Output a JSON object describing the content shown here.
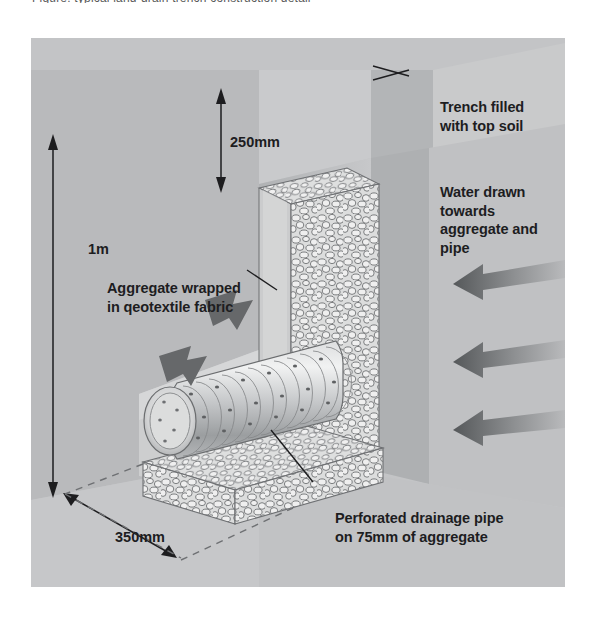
{
  "figure": {
    "clipped_caption_top": "Figure: typical land-drain trench construction detail",
    "background_color": "#c3c4c6",
    "panel": {
      "x": 31,
      "y": 38,
      "width": 534,
      "height": 549
    }
  },
  "labels": {
    "trench": "Trench filled\nwith top soil",
    "water": "Water drawn towards\naggregate and pipe",
    "aggregate": "Aggregate wrapped\nin qeotextile fabric",
    "pipe": "Perforated drainage pipe\non 75mm of aggregate"
  },
  "dimensions": {
    "depth_total": "1m",
    "topsoil_cover": "250mm",
    "trench_width": "350mm",
    "aggregate_bed": "75mm"
  },
  "colors": {
    "soil_light": "#d2d3d4",
    "soil_mid": "#c3c4c6",
    "soil_dark": "#a9abad",
    "soil_face": "#b6b8ba",
    "aggregate_fill": "#e2e3e3",
    "aggregate_stone": "#eceded",
    "stone_outline": "#6e7073",
    "pipe_light": "#e6e7e7",
    "pipe_shade": "#9a9c9e",
    "arrow_dark": "#5e6062",
    "line_dark": "#1d1d1f",
    "text": "#1d1d1f"
  },
  "elements": {
    "water_arrow_count": 3,
    "aggregate_arrow_count": 2,
    "pipe_type": "corrugated perforated drainage pipe",
    "geotextile": "aggregate wrapped in geotextile fabric"
  }
}
